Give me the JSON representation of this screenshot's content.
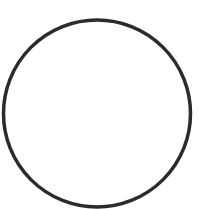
{
  "canvas": {
    "width": 209,
    "height": 209,
    "background": "#ffffff"
  },
  "shapes": [
    {
      "type": "circle",
      "name": "circle-outline",
      "cx": 97,
      "cy": 113.5,
      "r": 93.5,
      "stroke": "#2b2b2b",
      "stroke_width": 3.5,
      "fill": "none"
    }
  ]
}
